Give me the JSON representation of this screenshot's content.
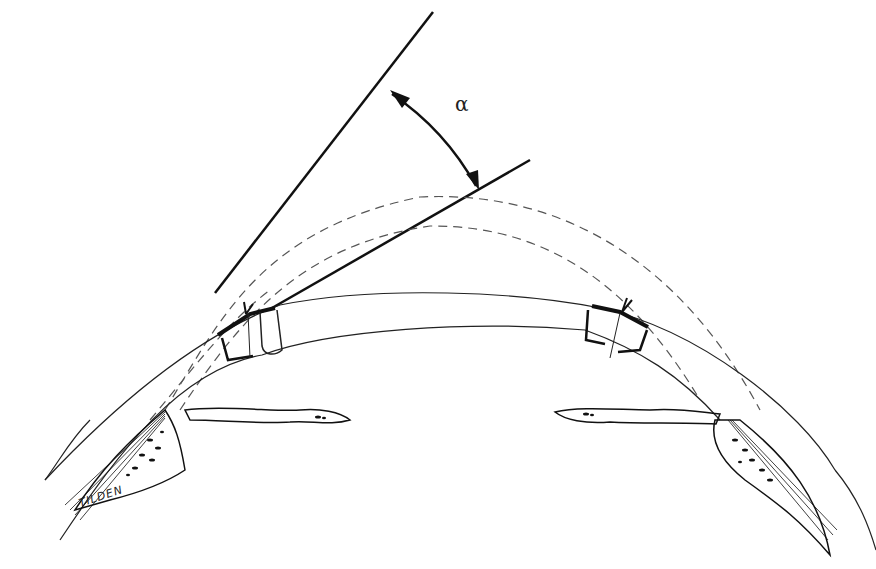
{
  "diagram": {
    "type": "medical-illustration",
    "angle_label": "α",
    "artist_signature": "TILDEN",
    "elements": {
      "tangent_lines": 2,
      "dashed_contours": 2,
      "corneal_surfaces": 2,
      "sutured_incisions": 2,
      "iris_segments": 2,
      "angle_tissue_regions": 2
    },
    "colors": {
      "ink": "#111111",
      "dashed": "#555555",
      "background": "#ffffff"
    }
  }
}
